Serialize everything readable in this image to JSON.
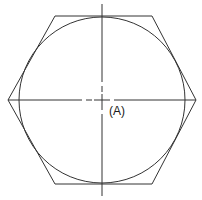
{
  "diagram": {
    "label": "(A)",
    "shapes": {
      "hexagon": {
        "points": [
          [
            8,
            100
          ],
          [
            55,
            16
          ],
          [
            152,
            16
          ],
          [
            196,
            100
          ],
          [
            152,
            184
          ],
          [
            55,
            184
          ]
        ]
      },
      "circle": {
        "cx": 102,
        "cy": 100,
        "r": 83
      },
      "centerlines": {
        "horizontal_y": 100,
        "vertical_x": 102
      }
    },
    "stroke_color": "#333333"
  }
}
